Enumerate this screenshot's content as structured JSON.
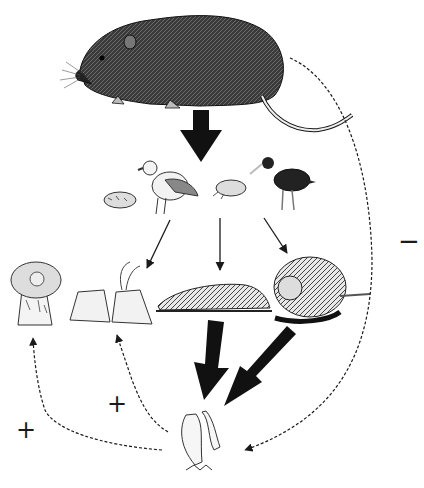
{
  "diagram": {
    "type": "food-web",
    "nodes": [
      {
        "id": "rat",
        "label": "Rat",
        "icon": "rat-icon"
      },
      {
        "id": "crab1",
        "label": "Crab",
        "icon": "crab-icon"
      },
      {
        "id": "gull",
        "label": "Gull",
        "icon": "gull-icon"
      },
      {
        "id": "crab2",
        "label": "Crab",
        "icon": "crab-icon"
      },
      {
        "id": "oystercatcher",
        "label": "Oystercatcher",
        "icon": "oystercatcher-icon"
      },
      {
        "id": "anemone",
        "label": "Sea anemone",
        "icon": "anemone-icon"
      },
      {
        "id": "barnacles",
        "label": "Barnacles",
        "icon": "barnacle-icon"
      },
      {
        "id": "limpet",
        "label": "Limpet",
        "icon": "limpet-icon"
      },
      {
        "id": "snail",
        "label": "Snail",
        "icon": "snail-icon"
      },
      {
        "id": "algae",
        "label": "Algae",
        "icon": "algae-icon"
      }
    ],
    "edges": [
      {
        "from": "rat",
        "to": "predators",
        "style": "thick"
      },
      {
        "from": "predators",
        "to": "barnacles",
        "style": "thin"
      },
      {
        "from": "predators",
        "to": "limpet",
        "style": "thin"
      },
      {
        "from": "predators",
        "to": "snail",
        "style": "thin"
      },
      {
        "from": "limpet",
        "to": "algae",
        "style": "thick"
      },
      {
        "from": "snail",
        "to": "algae",
        "style": "thick"
      },
      {
        "from": "rat",
        "to": "algae",
        "style": "dashed",
        "sign": "−"
      },
      {
        "from": "algae",
        "to": "anemone",
        "style": "dashed",
        "sign": "+"
      },
      {
        "from": "algae",
        "to": "barnacles",
        "style": "dashed",
        "sign": "+"
      }
    ],
    "signs": {
      "minus": "−",
      "plus_left": "+",
      "plus_mid": "+"
    }
  }
}
